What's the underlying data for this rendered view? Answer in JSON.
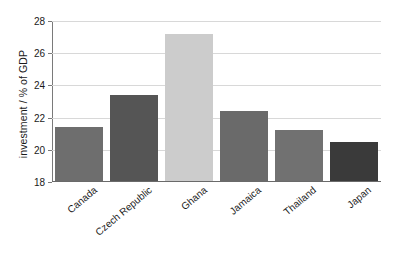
{
  "chart_data": {
    "type": "bar",
    "title": "",
    "xlabel": "",
    "ylabel": "investment / % of GDP",
    "ylim": [
      18,
      28
    ],
    "yticks": [
      18,
      20,
      22,
      24,
      26,
      28
    ],
    "ytick_labels": [
      "18",
      "20",
      "22",
      "24",
      "26",
      "28"
    ],
    "grid": true,
    "legend": "none",
    "categories": [
      "Canada",
      "Czech Republic",
      "Ghana",
      "Jamaica",
      "Thailand",
      "Japan"
    ],
    "values": [
      21.4,
      23.4,
      27.2,
      22.4,
      21.2,
      20.5
    ],
    "bar_colors": [
      "#6e6e6e",
      "#555555",
      "#cccccc",
      "#6a6a6a",
      "#717171",
      "#3a3a3a"
    ],
    "series": [
      {
        "name": "investment",
        "values": [
          21.4,
          23.4,
          27.2,
          22.4,
          21.2,
          20.5
        ]
      }
    ]
  },
  "axis_colors": {
    "grid": "#d8d8d8",
    "axis": "#7a7a7a",
    "text": "#1a1a1a"
  }
}
